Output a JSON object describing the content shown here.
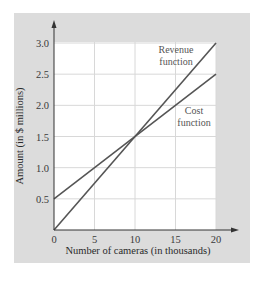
{
  "chart_data": {
    "type": "line",
    "title": "",
    "xlabel": "Number of cameras (in thousands)",
    "ylabel": "Amount (in $ millions)",
    "xlim": [
      0,
      20
    ],
    "ylim": [
      0,
      3.0
    ],
    "x_ticks": [
      0,
      5,
      10,
      15,
      20
    ],
    "x_tick_labels": [
      "0",
      "5",
      "10",
      "15",
      "20"
    ],
    "y_ticks": [
      0.5,
      1.0,
      1.5,
      2.0,
      2.5,
      3.0
    ],
    "y_tick_labels": [
      "0.5",
      "1.0",
      "1.5",
      "2.0",
      "2.5",
      "3.0"
    ],
    "grid": true,
    "legend": "none (inline annotations)",
    "series": [
      {
        "name": "Revenue function",
        "x": [
          0,
          20
        ],
        "values": [
          0,
          3.0
        ],
        "annotation": [
          "Revenue",
          "function"
        ]
      },
      {
        "name": "Cost function",
        "x": [
          0,
          20
        ],
        "values": [
          0.5,
          2.5
        ],
        "annotation": [
          "Cost",
          "function"
        ]
      }
    ],
    "break_even_point": {
      "x": 10,
      "y": 1.5
    }
  },
  "colors": {
    "panel": "#dcdcdc",
    "plot_bg": "#ffffff",
    "grid": "#d8d8d8",
    "line": "#555555",
    "axis": "#333333"
  }
}
